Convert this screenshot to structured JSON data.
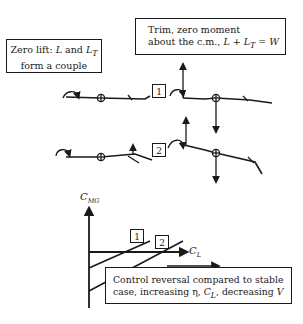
{
  "annotations": {
    "zero_lift": {
      "line1_prefix": "Zero lift: ",
      "L": "L",
      "and": " and ",
      "LT": "L",
      "LT_sub": "T",
      "line2": "form a couple"
    },
    "trim": {
      "line1": "Trim, zero moment",
      "line2_prefix": "about the c.m.,  ",
      "L": "L",
      "plus": " + ",
      "LT": "L",
      "LT_sub": "T",
      "eq": " = ",
      "W": "W"
    },
    "reversal": {
      "line1": "Control reversal compared to stable",
      "line2_prefix": "case, increasing η, ",
      "CL": "C",
      "CL_sub": "L",
      "line2_suffix": ", decreasing ",
      "V": "V"
    }
  },
  "configurations": [
    {
      "tag": "1",
      "description": "wing and tail with trailing-edge flap deflection, level"
    },
    {
      "tag": "2",
      "description": "wing and tail with larger control deflection, nose tilted"
    }
  ],
  "chart": {
    "y_axis_label": "C",
    "y_axis_sub": "MG",
    "x_axis_label": "C",
    "x_axis_sub": "L",
    "curves": [
      {
        "tag": "1",
        "slope": "positive"
      },
      {
        "tag": "2",
        "slope": "positive"
      }
    ]
  },
  "colors": {
    "ink": "#1a1a1a",
    "background": "#ffffff"
  }
}
